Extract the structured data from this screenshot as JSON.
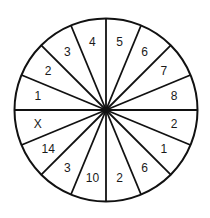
{
  "diagram": {
    "type": "number-wheel",
    "center": [
      106,
      110
    ],
    "radius": 91.5,
    "sector_count": 16,
    "start_angle_deg": -90,
    "direction": "clockwise",
    "stroke_color": "#111111",
    "background_color": "#ffffff",
    "sectors": [
      {
        "label": "5"
      },
      {
        "label": "6"
      },
      {
        "label": "7"
      },
      {
        "label": "8"
      },
      {
        "label": "2"
      },
      {
        "label": "1"
      },
      {
        "label": "6"
      },
      {
        "label": "2"
      },
      {
        "label": "10"
      },
      {
        "label": "3"
      },
      {
        "label": "14"
      },
      {
        "label": "X"
      },
      {
        "label": "1"
      },
      {
        "label": "2"
      },
      {
        "label": "3"
      },
      {
        "label": "4"
      }
    ]
  }
}
